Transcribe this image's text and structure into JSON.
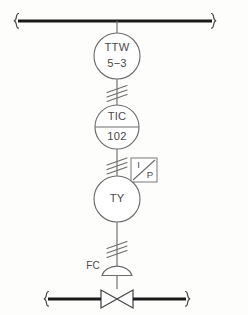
{
  "diagram": {
    "type": "p-and-id",
    "colors": {
      "pipe": "#1a1a1a",
      "signal": "#6d6d6d",
      "background": "#fdfdfc",
      "text": "#4a4a4a"
    }
  },
  "process_lines": {
    "top": {
      "name": "upper-process-line",
      "left_break": "line-break-bracket",
      "right_break": "line-break-bracket"
    },
    "bottom": {
      "name": "lower-process-line",
      "left_break": "line-break-bracket",
      "right_break": "line-break-bracket"
    }
  },
  "instruments": [
    {
      "id": "ttw",
      "shape": "circle",
      "divided": false,
      "tag_top": "TTW",
      "tag_bottom": "5−3",
      "icon": "instrument-bubble-icon"
    },
    {
      "id": "tic",
      "shape": "circle",
      "divided": true,
      "tag_top": "TIC",
      "tag_bottom": "102",
      "icon": "instrument-bubble-icon"
    },
    {
      "id": "ty",
      "shape": "circle",
      "divided": false,
      "tag_top": "TY",
      "tag_bottom": "",
      "icon": "instrument-bubble-icon"
    }
  ],
  "transducer": {
    "id": "ip-transducer",
    "shape": "square-with-diagonal",
    "input_letter": "I",
    "output_letter": "P",
    "icon": "i-to-p-transducer-icon"
  },
  "signal_connections": [
    {
      "id": "ttw-to-tic",
      "type": "electric",
      "hash_marks": 3,
      "icon": "electric-signal-icon"
    },
    {
      "id": "tic-to-ty",
      "type": "electric",
      "hash_marks": 3,
      "icon": "electric-signal-icon"
    },
    {
      "id": "ty-to-valve",
      "type": "electric",
      "hash_marks": 3,
      "icon": "electric-signal-icon"
    }
  ],
  "valve": {
    "id": "control-valve",
    "fail_action_label": "FC",
    "fail_action_meaning": "Fail Closed",
    "actuator_type": "diaphragm",
    "body_type": "globe",
    "icon": "control-valve-icon",
    "actuator_icon": "diaphragm-actuator-icon"
  }
}
